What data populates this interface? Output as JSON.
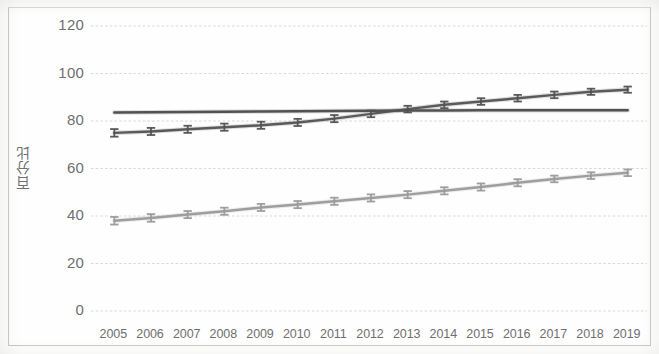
{
  "chart_data": {
    "type": "line",
    "title": "",
    "xlabel": "",
    "ylabel": "百分比",
    "ylim": [
      0,
      120
    ],
    "ytick_step": 20,
    "yticks": [
      120,
      100,
      80,
      60,
      40,
      20,
      0
    ],
    "grid": "horizontal",
    "legend": "none",
    "error_bars": true,
    "x": [
      2005,
      2006,
      2007,
      2008,
      2009,
      2010,
      2011,
      2012,
      2013,
      2014,
      2015,
      2016,
      2017,
      2018,
      2019
    ],
    "categories": [
      "2005",
      "2006",
      "2007",
      "2008",
      "2009",
      "2010",
      "2011",
      "2012",
      "2013",
      "2014",
      "2015",
      "2016",
      "2017",
      "2018",
      "2019"
    ],
    "series": [
      {
        "name": "series-flat-upper",
        "color": "#4a4a4a",
        "marker": "none",
        "error_bars": false,
        "values": [
          83.6,
          83.7,
          83.8,
          83.9,
          84.0,
          84.1,
          84.2,
          84.3,
          84.4,
          84.4,
          84.5,
          84.5,
          84.5,
          84.5,
          84.5
        ]
      },
      {
        "name": "series-rising-dark",
        "color": "#525252",
        "marker": "error-bar",
        "error_bars": true,
        "values": [
          75.0,
          75.6,
          76.5,
          77.4,
          78.2,
          79.4,
          81.0,
          83.0,
          85.0,
          86.8,
          88.2,
          89.6,
          91.0,
          92.3,
          93.2
        ],
        "errors": [
          1.6,
          1.5,
          1.5,
          1.5,
          1.5,
          1.5,
          1.5,
          1.4,
          1.4,
          1.4,
          1.4,
          1.4,
          1.4,
          1.3,
          1.3
        ]
      },
      {
        "name": "series-rising-light",
        "color": "#9a9a9a",
        "marker": "error-bar",
        "error_bars": true,
        "values": [
          38.0,
          39.2,
          40.6,
          42.0,
          43.6,
          44.8,
          46.2,
          47.6,
          49.0,
          50.6,
          52.2,
          54.0,
          55.6,
          57.0,
          58.2
        ],
        "errors": [
          1.6,
          1.6,
          1.5,
          1.5,
          1.5,
          1.5,
          1.5,
          1.5,
          1.5,
          1.5,
          1.5,
          1.5,
          1.4,
          1.4,
          1.4
        ]
      }
    ]
  }
}
